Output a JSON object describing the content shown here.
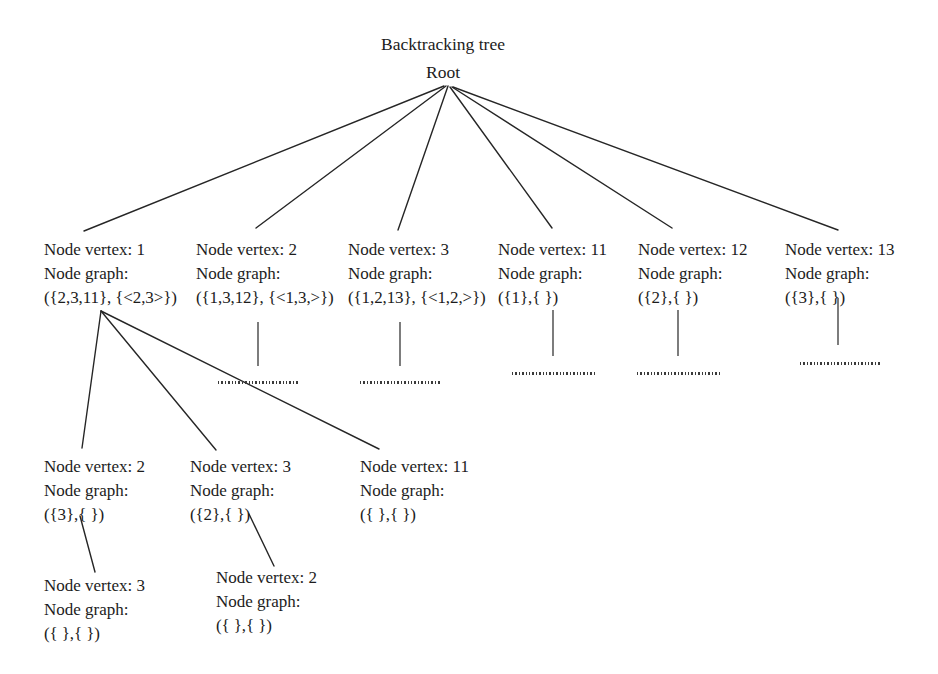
{
  "diagram": {
    "title": "Backtracking tree",
    "root_label": "Root",
    "labels": {
      "vertex_prefix": "Node vertex: ",
      "graph_prefix": "Node graph:"
    },
    "nodes": [
      {
        "id": "root",
        "level": 0,
        "vertex_line": "Root",
        "graph_line": "",
        "graph_value": "",
        "x": 443,
        "y": 60
      },
      {
        "id": "n1",
        "level": 1,
        "vertex_line": "Node vertex: 1",
        "graph_line": "Node graph:",
        "graph_value": "({2,3,11}, {<2,3>})",
        "x": 44,
        "y": 238
      },
      {
        "id": "n2",
        "level": 1,
        "vertex_line": "Node vertex: 2",
        "graph_line": "Node graph:",
        "graph_value": "({1,3,12}, {<1,3,>})",
        "x": 196,
        "y": 238
      },
      {
        "id": "n3",
        "level": 1,
        "vertex_line": "Node vertex: 3",
        "graph_line": "Node graph:",
        "graph_value": "({1,2,13}, {<1,2,>})",
        "x": 348,
        "y": 238
      },
      {
        "id": "n11",
        "level": 1,
        "vertex_line": "Node vertex: 11",
        "graph_line": "Node graph:",
        "graph_value": "({1},{ })",
        "x": 498,
        "y": 238
      },
      {
        "id": "n12",
        "level": 1,
        "vertex_line": "Node vertex: 12",
        "graph_line": "Node graph:",
        "graph_value": "({2},{ })",
        "x": 638,
        "y": 238
      },
      {
        "id": "n13",
        "level": 1,
        "vertex_line": "Node vertex: 13",
        "graph_line": "Node graph:",
        "graph_value": "({3},{ })",
        "x": 785,
        "y": 238
      },
      {
        "id": "n1-2",
        "level": 2,
        "vertex_line": "Node vertex: 2",
        "graph_line": "Node graph:",
        "graph_value": "({3},{ })",
        "x": 44,
        "y": 455
      },
      {
        "id": "n1-3",
        "level": 2,
        "vertex_line": "Node vertex: 3",
        "graph_line": "Node graph:",
        "graph_value": "({2},{ })",
        "x": 190,
        "y": 455
      },
      {
        "id": "n1-11",
        "level": 2,
        "vertex_line": "Node vertex: 11",
        "graph_line": "Node graph:",
        "graph_value": "({ },{ })",
        "x": 360,
        "y": 455
      },
      {
        "id": "n1-2-3",
        "level": 3,
        "vertex_line": "Node vertex: 3",
        "graph_line": "Node graph:",
        "graph_value": "({ },{ })",
        "x": 44,
        "y": 574
      },
      {
        "id": "n1-3-2",
        "level": 3,
        "vertex_line": "Node vertex: 2",
        "graph_line": "Node graph:",
        "graph_value": "({ },{ })",
        "x": 216,
        "y": 566
      }
    ],
    "edges": [
      {
        "from": "root",
        "to": "n1",
        "x1": 444,
        "y1": 86,
        "x2": 84,
        "y2": 231
      },
      {
        "from": "root",
        "to": "n2",
        "x1": 446,
        "y1": 86,
        "x2": 256,
        "y2": 228
      },
      {
        "from": "root",
        "to": "n3",
        "x1": 448,
        "y1": 86,
        "x2": 398,
        "y2": 230
      },
      {
        "from": "root",
        "to": "n11",
        "x1": 450,
        "y1": 87,
        "x2": 552,
        "y2": 228
      },
      {
        "from": "root",
        "to": "n12",
        "x1": 452,
        "y1": 87,
        "x2": 672,
        "y2": 228
      },
      {
        "from": "root",
        "to": "n13",
        "x1": 453,
        "y1": 87,
        "x2": 838,
        "y2": 230
      },
      {
        "from": "n1",
        "to": "n1-2",
        "x1": 101,
        "y1": 311,
        "x2": 82,
        "y2": 448
      },
      {
        "from": "n1",
        "to": "n1-3",
        "x1": 101,
        "y1": 311,
        "x2": 216,
        "y2": 450
      },
      {
        "from": "n1",
        "to": "n1-11",
        "x1": 101,
        "y1": 311,
        "x2": 379,
        "y2": 449
      },
      {
        "from": "n1-2",
        "to": "n1-2-3",
        "x1": 80,
        "y1": 516,
        "x2": 95,
        "y2": 572
      },
      {
        "from": "n1-3",
        "to": "n1-3-2",
        "x1": 249,
        "y1": 514,
        "x2": 274,
        "y2": 566
      }
    ],
    "continuation_marks": [
      {
        "under": "n2",
        "line_x": 258,
        "line_y1": 322,
        "line_y2": 366,
        "dots_x": 218,
        "dots_y": 381,
        "dots_w": 82
      },
      {
        "under": "n3",
        "line_x": 400,
        "line_y1": 322,
        "line_y2": 366,
        "dots_x": 360,
        "dots_y": 381,
        "dots_w": 82
      },
      {
        "under": "n11",
        "line_x": 553,
        "line_y1": 310,
        "line_y2": 356,
        "dots_x": 512,
        "dots_y": 372,
        "dots_w": 84
      },
      {
        "under": "n12",
        "line_x": 678,
        "line_y1": 310,
        "line_y2": 356,
        "dots_x": 637,
        "dots_y": 372,
        "dots_w": 84
      },
      {
        "under": "n13",
        "line_x": 838,
        "line_y1": 298,
        "line_y2": 345,
        "dots_x": 800,
        "dots_y": 362,
        "dots_w": 80
      }
    ],
    "colors": {
      "text": "#1c1c1c",
      "edge": "#262626",
      "background": "#ffffff"
    }
  }
}
